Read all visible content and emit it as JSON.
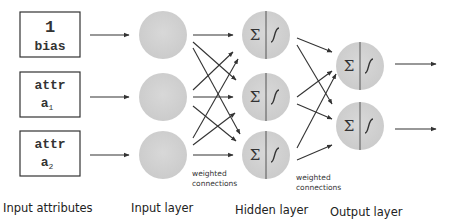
{
  "colors": {
    "node_fill": "#d3d3d3",
    "line": "#333333",
    "box_border": "#333333",
    "text": "#222222"
  },
  "input_attributes": [
    {
      "top": "1",
      "bottom": "bias",
      "subscript": ""
    },
    {
      "top": "attr",
      "bottom": "a",
      "subscript": "1"
    },
    {
      "top": "attr",
      "bottom": "a",
      "subscript": "2"
    }
  ],
  "node_symbols": {
    "sum": "Σ",
    "activation": "sigmoid"
  },
  "connection_labels": {
    "input_to_hidden": [
      "weighted",
      "connections"
    ],
    "hidden_to_output": [
      "weighted",
      "connections"
    ]
  },
  "layer_labels": {
    "input_attributes": "Input attributes",
    "input_layer": "Input layer",
    "hidden_layer": "Hidden layer",
    "output_layer": "Output layer"
  },
  "layers": {
    "input_nodes": 3,
    "hidden_nodes": 3,
    "output_nodes": 2
  }
}
